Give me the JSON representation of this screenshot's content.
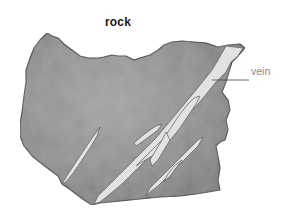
{
  "diagram": {
    "title": "rock",
    "labels": [
      {
        "text": "vein",
        "points_to": "vein"
      }
    ],
    "elements": [
      {
        "name": "rock",
        "description": "irregular grey rock fragment"
      },
      {
        "name": "vein",
        "description": "light mineral veins crossing the rock diagonally"
      }
    ]
  },
  "colors": {
    "background": "#ffffff",
    "rock_fill": "#8c8c8c",
    "rock_outline": "#3a3a3a",
    "vein_fill": "#e4e4e4",
    "label_text": "#8a8a8a",
    "title_text": "#1a1a1a",
    "leader_line": "#444444"
  }
}
